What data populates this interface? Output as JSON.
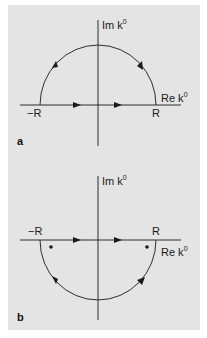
{
  "figure": {
    "panels": [
      {
        "id": "a",
        "tag": "a",
        "imaginary_axis_label": "Im k",
        "real_axis_label": "Re k",
        "axis_superscript": "0",
        "left_endpoint_label": "−R",
        "right_endpoint_label": "R",
        "contour": "upper semicircle, counterclockwise",
        "poles_shown": 0
      },
      {
        "id": "b",
        "tag": "b",
        "imaginary_axis_label": "Im k",
        "real_axis_label": "Re k",
        "axis_superscript": "0",
        "left_endpoint_label": "−R",
        "right_endpoint_label": "R",
        "contour": "lower semicircle, clockwise",
        "poles_shown": 2
      }
    ],
    "colors": {
      "background": "#e4e4e4",
      "ink": "#1a1a1a"
    }
  }
}
